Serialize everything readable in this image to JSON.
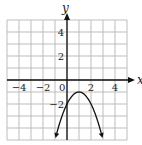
{
  "chart_data": {
    "type": "line",
    "title": "",
    "xlabel": "x",
    "ylabel": "y",
    "xlim": [
      -5,
      5
    ],
    "ylim": [
      -5,
      5
    ],
    "grid": true,
    "x_ticks": [
      -4,
      -2,
      0,
      2,
      4
    ],
    "x_tick_labels": [
      "−4",
      "−2",
      "0",
      "2",
      "4"
    ],
    "y_ticks": [
      4,
      2,
      -2
    ],
    "y_tick_labels": [
      "4",
      "2",
      "−2"
    ],
    "series": [
      {
        "name": "parabola",
        "equation": "y = -(x - 1)^2 - 1",
        "vertex": [
          1,
          -1
        ],
        "y_intercept": -2,
        "x": [
          -1,
          -0.5,
          0,
          0.5,
          1,
          1.5,
          2,
          2.5,
          3
        ],
        "y": [
          -5,
          -3.25,
          -2,
          -1.25,
          -1,
          -1.25,
          -2,
          -3.25,
          -5
        ],
        "arrows_at_ends": true
      }
    ]
  },
  "labels": {
    "x_axis": "x",
    "y_axis": "y"
  }
}
